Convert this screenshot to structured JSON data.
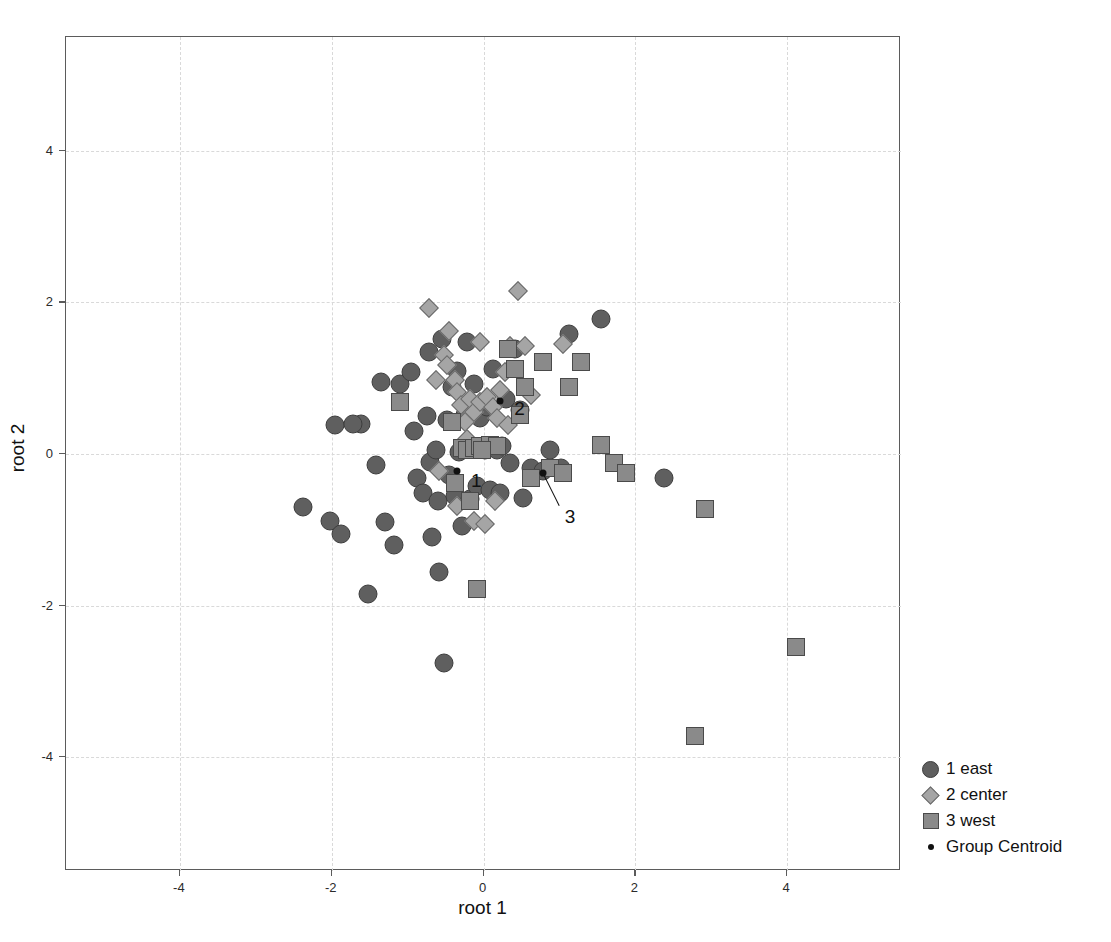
{
  "chart_data": {
    "type": "scatter",
    "title": "",
    "xlabel": "root 1",
    "ylabel": "root 2",
    "xlim": [
      -5.5,
      5.5
    ],
    "ylim": [
      -5.5,
      5.5
    ],
    "xticks": [
      -4,
      -2,
      0,
      2,
      4
    ],
    "yticks": [
      -4,
      -2,
      0,
      2,
      4
    ],
    "xtick_labels": [
      "-4",
      "-2",
      "0",
      "2",
      "4"
    ],
    "ytick_labels": [
      "-4",
      "-2",
      "0",
      "2",
      "4"
    ],
    "grid": true,
    "grid_style": "dashed",
    "legend_position": "outside-right-bottom",
    "colors": {
      "group1_fill": "#5f5f5f",
      "group1_stroke": "#3d3d3d",
      "group2_fill": "#a5a5a5",
      "group2_stroke": "#6a6a6a",
      "group3_fill": "#8a8a8a",
      "group3_stroke": "#4a4a4a",
      "centroid": "#111111",
      "grid": "#d9d9d9",
      "frame": "#5b5b5b"
    },
    "series": [
      {
        "name": "1 east",
        "marker": "circle",
        "points": [
          [
            -2.38,
            -0.7
          ],
          [
            -2.02,
            -0.88
          ],
          [
            -1.95,
            0.38
          ],
          [
            -1.62,
            0.4
          ],
          [
            -1.88,
            -1.05
          ],
          [
            -1.52,
            -1.85
          ],
          [
            -1.42,
            -0.15
          ],
          [
            -1.3,
            -0.9
          ],
          [
            -1.18,
            -1.2
          ],
          [
            -1.1,
            0.92
          ],
          [
            -0.95,
            1.08
          ],
          [
            -0.92,
            0.3
          ],
          [
            -0.88,
            -0.32
          ],
          [
            -0.8,
            -0.52
          ],
          [
            -0.75,
            0.5
          ],
          [
            -0.72,
            1.35
          ],
          [
            -0.7,
            -0.1
          ],
          [
            -0.62,
            0.05
          ],
          [
            -0.6,
            -0.62
          ],
          [
            -0.58,
            -1.55
          ],
          [
            -0.55,
            1.52
          ],
          [
            -0.52,
            -2.75
          ],
          [
            -0.48,
            0.45
          ],
          [
            -0.45,
            -0.28
          ],
          [
            -0.42,
            0.88
          ],
          [
            -0.38,
            -0.55
          ],
          [
            -0.35,
            1.1
          ],
          [
            -0.32,
            0.02
          ],
          [
            -0.28,
            -0.95
          ],
          [
            -0.25,
            0.52
          ],
          [
            -0.22,
            1.48
          ],
          [
            -0.18,
            -0.6
          ],
          [
            -0.15,
            0.08
          ],
          [
            -0.12,
            0.92
          ],
          [
            -0.08,
            -0.42
          ],
          [
            -0.05,
            0.48
          ],
          [
            0.02,
            0.05
          ],
          [
            0.05,
            0.62
          ],
          [
            0.08,
            -0.48
          ],
          [
            0.12,
            1.12
          ],
          [
            0.18,
            0.05
          ],
          [
            0.22,
            -0.52
          ],
          [
            0.3,
            0.72
          ],
          [
            0.35,
            -0.12
          ],
          [
            0.42,
            1.38
          ],
          [
            0.48,
            0.58
          ],
          [
            0.52,
            -0.58
          ],
          [
            0.62,
            -0.18
          ],
          [
            0.78,
            -0.22
          ],
          [
            0.88,
            0.05
          ],
          [
            1.02,
            -0.18
          ],
          [
            1.12,
            1.58
          ],
          [
            1.55,
            1.78
          ],
          [
            2.38,
            -0.32
          ],
          [
            -1.72,
            0.4
          ],
          [
            -1.35,
            0.95
          ],
          [
            -0.68,
            -1.1
          ],
          [
            0.25,
            0.1
          ]
        ]
      },
      {
        "name": "2 center",
        "marker": "diamond",
        "points": [
          [
            -0.72,
            1.92
          ],
          [
            -0.45,
            1.62
          ],
          [
            -0.52,
            1.3
          ],
          [
            -0.48,
            1.18
          ],
          [
            -0.38,
            0.98
          ],
          [
            -0.35,
            0.82
          ],
          [
            -0.3,
            0.65
          ],
          [
            -0.18,
            0.72
          ],
          [
            -0.25,
            0.42
          ],
          [
            -0.12,
            0.55
          ],
          [
            -0.05,
            0.68
          ],
          [
            0.05,
            0.75
          ],
          [
            0.12,
            0.62
          ],
          [
            0.18,
            0.48
          ],
          [
            0.22,
            0.85
          ],
          [
            0.28,
            1.08
          ],
          [
            0.35,
            1.42
          ],
          [
            0.45,
            2.15
          ],
          [
            0.55,
            1.42
          ],
          [
            0.62,
            0.78
          ],
          [
            1.05,
            1.45
          ],
          [
            -0.58,
            -0.22
          ],
          [
            -0.12,
            -0.88
          ],
          [
            0.02,
            -0.92
          ],
          [
            -0.35,
            -0.68
          ],
          [
            0.15,
            -0.62
          ],
          [
            -0.05,
            1.48
          ],
          [
            0.32,
            0.38
          ],
          [
            -0.22,
            0.2
          ],
          [
            -0.62,
            0.98
          ]
        ]
      },
      {
        "name": "3 west",
        "marker": "square",
        "points": [
          [
            -1.1,
            0.68
          ],
          [
            -0.42,
            0.42
          ],
          [
            -0.28,
            0.08
          ],
          [
            -0.22,
            0.05
          ],
          [
            -0.12,
            0.08
          ],
          [
            -0.05,
            0.1
          ],
          [
            -0.38,
            -0.38
          ],
          [
            -0.18,
            -0.62
          ],
          [
            -0.08,
            -1.78
          ],
          [
            0.08,
            0.12
          ],
          [
            0.18,
            0.1
          ],
          [
            0.32,
            1.38
          ],
          [
            0.42,
            1.12
          ],
          [
            0.48,
            0.52
          ],
          [
            0.55,
            0.88
          ],
          [
            0.78,
            1.22
          ],
          [
            0.88,
            -0.18
          ],
          [
            1.05,
            -0.25
          ],
          [
            1.12,
            0.88
          ],
          [
            1.28,
            1.22
          ],
          [
            1.55,
            0.12
          ],
          [
            1.72,
            -0.12
          ],
          [
            1.88,
            -0.25
          ],
          [
            2.92,
            -0.72
          ],
          [
            2.78,
            -3.72
          ],
          [
            4.12,
            -2.55
          ],
          [
            0.62,
            -0.32
          ],
          [
            -0.02,
            0.05
          ]
        ]
      }
    ],
    "centroids": [
      {
        "label": "1",
        "x": -0.35,
        "y": -0.22,
        "label_dx": 14,
        "label_dy": 10,
        "leader": false
      },
      {
        "label": "2",
        "x": 0.22,
        "y": 0.7,
        "label_dx": 14,
        "label_dy": 8,
        "leader": false
      },
      {
        "label": "3",
        "x": 0.78,
        "y": -0.25,
        "label_dx": 22,
        "label_dy": 44,
        "leader": true
      }
    ]
  },
  "legend": {
    "items": [
      {
        "label": "1 east",
        "marker": "circle"
      },
      {
        "label": "2 center",
        "marker": "diamond"
      },
      {
        "label": "3 west",
        "marker": "square"
      },
      {
        "label": "Group Centroid",
        "marker": "dot"
      }
    ]
  }
}
